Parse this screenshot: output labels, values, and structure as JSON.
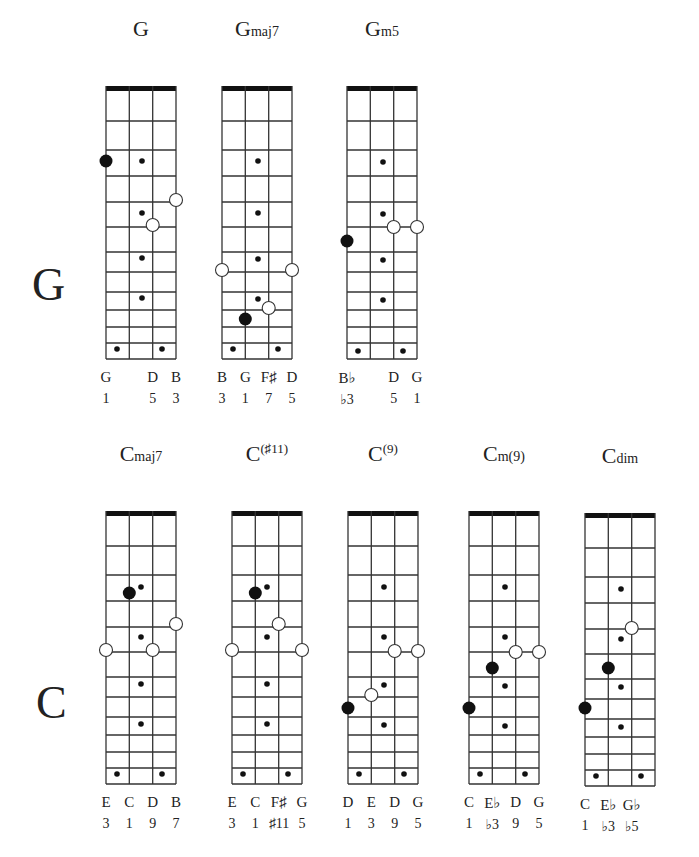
{
  "row_labels": [
    {
      "text": "G",
      "x": 32,
      "y": 262
    },
    {
      "text": "C",
      "x": 36,
      "y": 680
    }
  ],
  "geometry": {
    "width": 70,
    "string_x": [
      0,
      23.3,
      46.7,
      70
    ],
    "nut_height": 5,
    "fret_lines": [
      35,
      64,
      90,
      116,
      141,
      166,
      186,
      206,
      224,
      241,
      257,
      273
    ],
    "colors": {
      "line": "#333333",
      "nut": "#111111",
      "dot": "#111111",
      "bg": "#ffffff"
    }
  },
  "chords": [
    {
      "id": "G",
      "root": "G",
      "suffix": "",
      "suffix_style": "sfx",
      "x": 106,
      "y": 86,
      "notes": [
        "G",
        "",
        "D",
        "B"
      ],
      "degrees": [
        "1",
        "",
        "5",
        "3"
      ],
      "markers": [
        {
          "type": "big",
          "x": 0,
          "y": 75
        },
        {
          "type": "small",
          "x": 36,
          "y": 75
        },
        {
          "type": "small",
          "x": 36,
          "y": 127
        },
        {
          "type": "small",
          "x": 36,
          "y": 172
        },
        {
          "type": "small",
          "x": 36,
          "y": 212
        },
        {
          "type": "open",
          "x": 70,
          "y": 114
        },
        {
          "type": "open",
          "x": 46.7,
          "y": 139
        },
        {
          "type": "small",
          "x": 11,
          "y": 263
        },
        {
          "type": "small",
          "x": 56,
          "y": 263
        }
      ]
    },
    {
      "id": "Gmaj7",
      "root": "G",
      "suffix": "maj7",
      "suffix_style": "sfx",
      "x": 222,
      "y": 86,
      "notes": [
        "B",
        "G",
        "F♯",
        "D"
      ],
      "degrees": [
        "3",
        "1",
        "7",
        "5"
      ],
      "markers": [
        {
          "type": "small",
          "x": 36,
          "y": 75
        },
        {
          "type": "small",
          "x": 36,
          "y": 127
        },
        {
          "type": "small",
          "x": 36,
          "y": 173
        },
        {
          "type": "small",
          "x": 36,
          "y": 213
        },
        {
          "type": "open",
          "x": 0,
          "y": 184
        },
        {
          "type": "open",
          "x": 70,
          "y": 184
        },
        {
          "type": "open",
          "x": 46.7,
          "y": 222
        },
        {
          "type": "big",
          "x": 23.3,
          "y": 233
        },
        {
          "type": "small",
          "x": 11,
          "y": 263
        },
        {
          "type": "small",
          "x": 56,
          "y": 263
        }
      ]
    },
    {
      "id": "Gm5",
      "root": "G",
      "suffix": "m5",
      "suffix_style": "sfx",
      "x": 347,
      "y": 86,
      "notes": [
        "B♭",
        "",
        "D",
        "G"
      ],
      "degrees": [
        "♭3",
        "",
        "5",
        "1"
      ],
      "markers": [
        {
          "type": "small",
          "x": 36,
          "y": 76
        },
        {
          "type": "small",
          "x": 36,
          "y": 128
        },
        {
          "type": "small",
          "x": 36,
          "y": 174
        },
        {
          "type": "small",
          "x": 36,
          "y": 214
        },
        {
          "type": "open",
          "x": 46.7,
          "y": 141
        },
        {
          "type": "open",
          "x": 70,
          "y": 141
        },
        {
          "type": "big",
          "x": 0,
          "y": 155
        },
        {
          "type": "small",
          "x": 11,
          "y": 265
        },
        {
          "type": "small",
          "x": 56,
          "y": 265
        }
      ]
    },
    {
      "id": "Cmaj7",
      "root": "C",
      "suffix": "maj7",
      "suffix_style": "sfx",
      "x": 106,
      "y": 511,
      "notes": [
        "E",
        "C",
        "D",
        "B"
      ],
      "degrees": [
        "3",
        "1",
        "9",
        "7"
      ],
      "markers": [
        {
          "type": "big",
          "x": 23.3,
          "y": 82
        },
        {
          "type": "small",
          "x": 35,
          "y": 76
        },
        {
          "type": "open",
          "x": 70,
          "y": 113
        },
        {
          "type": "small",
          "x": 35,
          "y": 126
        },
        {
          "type": "open",
          "x": 0,
          "y": 139
        },
        {
          "type": "open",
          "x": 46.7,
          "y": 139
        },
        {
          "type": "small",
          "x": 35,
          "y": 173
        },
        {
          "type": "small",
          "x": 35,
          "y": 213
        },
        {
          "type": "small",
          "x": 11,
          "y": 263
        },
        {
          "type": "small",
          "x": 56,
          "y": 263
        }
      ]
    },
    {
      "id": "C#11",
      "root": "C",
      "suffix": "(♯11)",
      "suffix_style": "sup",
      "x": 232,
      "y": 511,
      "notes": [
        "E",
        "C",
        "F♯",
        "G"
      ],
      "degrees": [
        "3",
        "1",
        "♯11",
        "5"
      ],
      "markers": [
        {
          "type": "big",
          "x": 23.3,
          "y": 82
        },
        {
          "type": "small",
          "x": 35,
          "y": 76
        },
        {
          "type": "open",
          "x": 46.7,
          "y": 113
        },
        {
          "type": "small",
          "x": 35,
          "y": 126
        },
        {
          "type": "open",
          "x": 0,
          "y": 139
        },
        {
          "type": "open",
          "x": 70,
          "y": 139
        },
        {
          "type": "small",
          "x": 35,
          "y": 173
        },
        {
          "type": "small",
          "x": 35,
          "y": 213
        },
        {
          "type": "small",
          "x": 11,
          "y": 263
        },
        {
          "type": "small",
          "x": 56,
          "y": 263
        }
      ]
    },
    {
      "id": "C9",
      "root": "C",
      "suffix": "(9)",
      "suffix_style": "sup",
      "x": 348,
      "y": 511,
      "notes": [
        "D",
        "E",
        "D",
        "G"
      ],
      "degrees": [
        "1",
        "3",
        "9",
        "5"
      ],
      "markers": [
        {
          "type": "small",
          "x": 36,
          "y": 76
        },
        {
          "type": "small",
          "x": 36,
          "y": 126
        },
        {
          "type": "open",
          "x": 46.7,
          "y": 140
        },
        {
          "type": "open",
          "x": 70,
          "y": 140
        },
        {
          "type": "small",
          "x": 36,
          "y": 174
        },
        {
          "type": "open",
          "x": 23.3,
          "y": 184
        },
        {
          "type": "big",
          "x": 0,
          "y": 197
        },
        {
          "type": "small",
          "x": 36,
          "y": 214
        },
        {
          "type": "small",
          "x": 11,
          "y": 263
        },
        {
          "type": "small",
          "x": 56,
          "y": 263
        }
      ]
    },
    {
      "id": "Cm9",
      "root": "C",
      "suffix": "m(9)",
      "suffix_style": "sfx",
      "x": 469,
      "y": 511,
      "notes": [
        "C",
        "E♭",
        "D",
        "G"
      ],
      "degrees": [
        "1",
        "♭3",
        "9",
        "5"
      ],
      "markers": [
        {
          "type": "small",
          "x": 36,
          "y": 76
        },
        {
          "type": "small",
          "x": 36,
          "y": 126
        },
        {
          "type": "open",
          "x": 46.7,
          "y": 141
        },
        {
          "type": "open",
          "x": 70,
          "y": 141
        },
        {
          "type": "big",
          "x": 23.3,
          "y": 157
        },
        {
          "type": "small",
          "x": 36,
          "y": 175
        },
        {
          "type": "big",
          "x": 0,
          "y": 197
        },
        {
          "type": "small",
          "x": 36,
          "y": 215
        },
        {
          "type": "small",
          "x": 11,
          "y": 263
        },
        {
          "type": "small",
          "x": 56,
          "y": 263
        }
      ]
    },
    {
      "id": "Cdim",
      "root": "C",
      "suffix": "dim",
      "suffix_style": "sfx",
      "x": 585,
      "y": 513,
      "notes": [
        "C",
        "E♭",
        "G♭",
        ""
      ],
      "degrees": [
        "1",
        "♭3",
        "♭5",
        ""
      ],
      "markers": [
        {
          "type": "small",
          "x": 36,
          "y": 76
        },
        {
          "type": "open",
          "x": 46.7,
          "y": 115
        },
        {
          "type": "small",
          "x": 36,
          "y": 126
        },
        {
          "type": "big",
          "x": 23.3,
          "y": 155
        },
        {
          "type": "small",
          "x": 36,
          "y": 174
        },
        {
          "type": "big",
          "x": 0,
          "y": 195
        },
        {
          "type": "small",
          "x": 36,
          "y": 214
        },
        {
          "type": "small",
          "x": 11,
          "y": 263
        },
        {
          "type": "small",
          "x": 56,
          "y": 263
        }
      ]
    }
  ]
}
